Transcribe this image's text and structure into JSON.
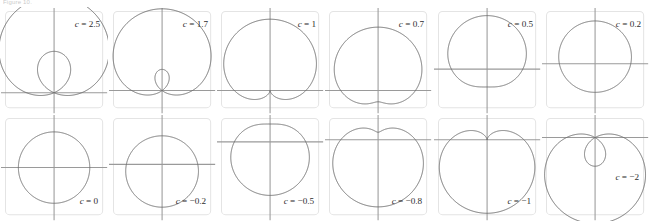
{
  "caption": "Figure 10.",
  "figure": {
    "equation": "r = 1 + c sin(theta)",
    "rows": 2,
    "columns": 6,
    "curve_color": "#6d6d6d",
    "axis_color": "#9a9a9a",
    "frame_color": "#e4e4e4",
    "background": "#ffffff"
  },
  "chart_data": {
    "type": "line",
    "xlabel": "",
    "ylabel": "",
    "grid": false,
    "legend": "none",
    "panels": [
      {
        "index": 1,
        "label_var": "c",
        "label_eq": "= 2.5",
        "label_full": "c = 2.5",
        "c": 2.5,
        "shape": "limacon with inner loop",
        "label_position": "upper-right",
        "axis_y_fraction": 0.8,
        "axis_x_fraction": 0.5,
        "scale": 0.255
      },
      {
        "index": 2,
        "label_var": "c",
        "label_eq": "= 1.7",
        "label_full": "c = 1.7",
        "c": 1.7,
        "shape": "limacon with small inner loop",
        "label_position": "upper-right",
        "axis_y_fraction": 0.78,
        "axis_x_fraction": 0.5,
        "scale": 0.28
      },
      {
        "index": 3,
        "label_var": "c",
        "label_eq": "= 1",
        "label_full": "c = 1",
        "c": 1,
        "shape": "cardioid, cusp at origin pointing down",
        "label_position": "upper-right",
        "axis_y_fraction": 0.78,
        "axis_x_fraction": 0.5,
        "scale": 0.33
      },
      {
        "index": 4,
        "label_var": "c",
        "label_eq": "= 0.7",
        "label_full": "c = 0.7",
        "c": 0.7,
        "shape": "dimpled limacon",
        "label_position": "upper-right",
        "axis_y_fraction": 0.78,
        "axis_x_fraction": 0.5,
        "scale": 0.345
      },
      {
        "index": 5,
        "label_var": "c",
        "label_eq": "= 0.5",
        "label_full": "c = 0.5",
        "c": 0.5,
        "shape": "convex limacon",
        "label_position": "upper-right",
        "axis_y_fraction": 0.58,
        "axis_x_fraction": 0.5,
        "scale": 0.33
      },
      {
        "index": 6,
        "label_var": "c",
        "label_eq": "= 0.2",
        "label_full": "c = 0.2",
        "c": 0.2,
        "shape": "nearly circular oval",
        "label_position": "upper-right",
        "axis_y_fraction": 0.53,
        "axis_x_fraction": 0.5,
        "scale": 0.33
      },
      {
        "index": 7,
        "label_var": "c",
        "label_eq": "= 0",
        "label_full": "c = 0",
        "c": 0,
        "shape": "circle",
        "label_position": "lower-right",
        "axis_y_fraction": 0.5,
        "axis_x_fraction": 0.5,
        "scale": 0.33
      },
      {
        "index": 8,
        "label_var": "c",
        "label_eq": "= −0.2",
        "label_full": "c = −0.2",
        "c": -0.2,
        "shape": "nearly circular oval",
        "label_position": "lower-right",
        "axis_y_fraction": 0.47,
        "axis_x_fraction": 0.5,
        "scale": 0.33
      },
      {
        "index": 9,
        "label_var": "c",
        "label_eq": "= −0.5",
        "label_full": "c = −0.5",
        "c": -0.5,
        "shape": "convex limacon",
        "label_position": "lower-right",
        "axis_y_fraction": 0.26,
        "axis_x_fraction": 0.5,
        "scale": 0.33
      },
      {
        "index": 10,
        "label_var": "c",
        "label_eq": "= −0.8",
        "label_full": "c = −0.8",
        "c": -0.8,
        "shape": "dimpled limacon, dimple on top",
        "label_position": "lower-right",
        "axis_y_fraction": 0.24,
        "axis_x_fraction": 0.5,
        "scale": 0.345
      },
      {
        "index": 11,
        "label_var": "c",
        "label_eq": "= −1",
        "label_full": "c = −1",
        "c": -1,
        "shape": "cardioid, cusp at origin pointing up",
        "label_position": "lower-right",
        "axis_y_fraction": 0.24,
        "axis_x_fraction": 0.5,
        "scale": 0.34
      },
      {
        "index": 12,
        "label_var": "c",
        "label_eq": "= −2",
        "label_full": "c = −2",
        "c": -2,
        "shape": "limacon with inner loop above origin",
        "label_position": "middle-right",
        "axis_y_fraction": 0.22,
        "axis_x_fraction": 0.5,
        "scale": 0.265
      }
    ]
  }
}
